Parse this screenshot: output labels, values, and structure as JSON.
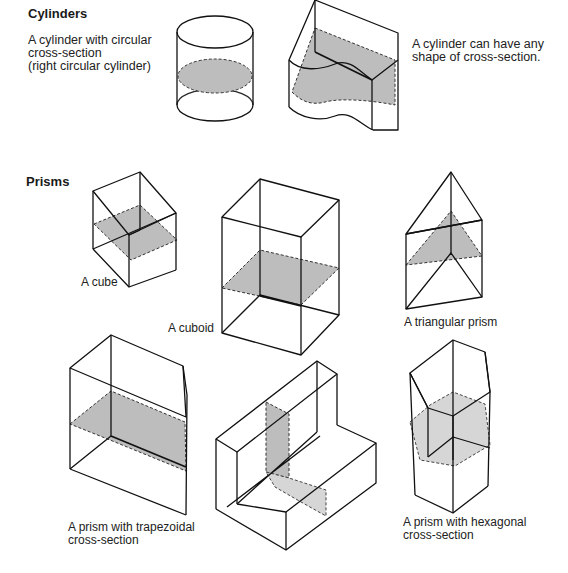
{
  "sections": {
    "cylinders": {
      "heading": "Cylinders"
    },
    "prisms": {
      "heading": "Prisms"
    }
  },
  "labels": {
    "circular_cylinder": [
      "A cylinder with circular",
      "cross-section",
      "(right circular cylinder)"
    ],
    "any_cylinder": [
      "A cylinder can have any",
      "shape of cross-section."
    ],
    "cube": "A cube",
    "cuboid": "A cuboid",
    "triangular_prism": "A triangular prism",
    "trapezoidal_prism": [
      "A prism with trapezoidal",
      "cross-section"
    ],
    "hexagonal_prism": [
      "A prism with hexagonal",
      "cross-section"
    ]
  },
  "colors": {
    "section_fill": "#bdbdbd",
    "edge": "#111111",
    "background": "#ffffff"
  }
}
